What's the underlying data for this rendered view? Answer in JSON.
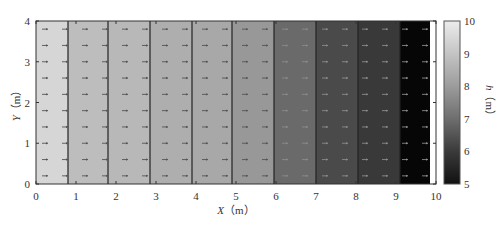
{
  "chart_data": {
    "type": "heatmap",
    "title": "",
    "xlabel": "X（m）",
    "xlabel_var": "X",
    "xlabel_unit": "（m）",
    "ylabel": "Y（m）",
    "ylabel_var": "Y",
    "ylabel_unit": "（m）",
    "xlim": [
      0,
      10
    ],
    "ylim": [
      0,
      4
    ],
    "x_ticks": [
      "0",
      "1",
      "2",
      "3",
      "4",
      "5",
      "6",
      "7",
      "8",
      "9",
      "10"
    ],
    "y_ticks": [
      "0",
      "1",
      "2",
      "3",
      "4"
    ],
    "colorbar": {
      "label": "h（m）",
      "label_var": "h",
      "label_unit": "（m）",
      "range": [
        5,
        10
      ],
      "ticks": [
        "5",
        "6",
        "7",
        "8",
        "9",
        "10"
      ],
      "colormap": "gray"
    },
    "bands": [
      {
        "x0": 0.0,
        "x1": 0.8,
        "h": 9.5,
        "color": "#d6d6d6"
      },
      {
        "x0": 0.8,
        "x1": 1.8,
        "h": 8.9,
        "color": "#bdbdbd"
      },
      {
        "x0": 1.8,
        "x1": 2.85,
        "h": 8.8,
        "color": "#b8b8b8"
      },
      {
        "x0": 2.85,
        "x1": 3.9,
        "h": 8.5,
        "color": "#aeaeae"
      },
      {
        "x0": 3.9,
        "x1": 4.9,
        "h": 8.3,
        "color": "#a8a8a8"
      },
      {
        "x0": 4.9,
        "x1": 5.95,
        "h": 7.9,
        "color": "#989898"
      },
      {
        "x0": 5.95,
        "x1": 7.0,
        "h": 6.8,
        "color": "#6a6a6a"
      },
      {
        "x0": 7.0,
        "x1": 8.05,
        "h": 6.0,
        "color": "#4a4a4a"
      },
      {
        "x0": 8.05,
        "x1": 9.1,
        "h": 5.6,
        "color": "#393939"
      },
      {
        "x0": 9.1,
        "x1": 9.85,
        "h": 5.0,
        "color": "#060606"
      },
      {
        "x0": 9.85,
        "x1": 10.0,
        "h": 10.0,
        "color": "#ffffff"
      }
    ],
    "vector_field": {
      "direction": "+x",
      "rows_y": [
        0.2,
        0.6,
        1.0,
        1.4,
        1.8,
        2.2,
        2.6,
        3.0,
        3.4,
        3.8
      ],
      "note": "uniform small arrows pointing in +X direction"
    },
    "grid": false,
    "legend": "colorbar right"
  }
}
